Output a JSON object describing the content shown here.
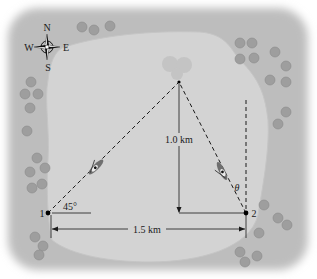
{
  "diagram": {
    "compass": {
      "north": "N",
      "south": "S",
      "east": "E",
      "west": "W"
    },
    "points": [
      {
        "id": "1",
        "label": "1"
      },
      {
        "id": "2",
        "label": "2"
      }
    ],
    "labels": {
      "baseline": "1.5 km",
      "height": "1.0 km",
      "angle_point1": "45°",
      "angle_point2": "θ"
    },
    "colors": {
      "land": "#bdbdbd",
      "lake": "#d2d2d2",
      "trees": "#9a9a9a",
      "lines": "#1a1a1a"
    }
  }
}
